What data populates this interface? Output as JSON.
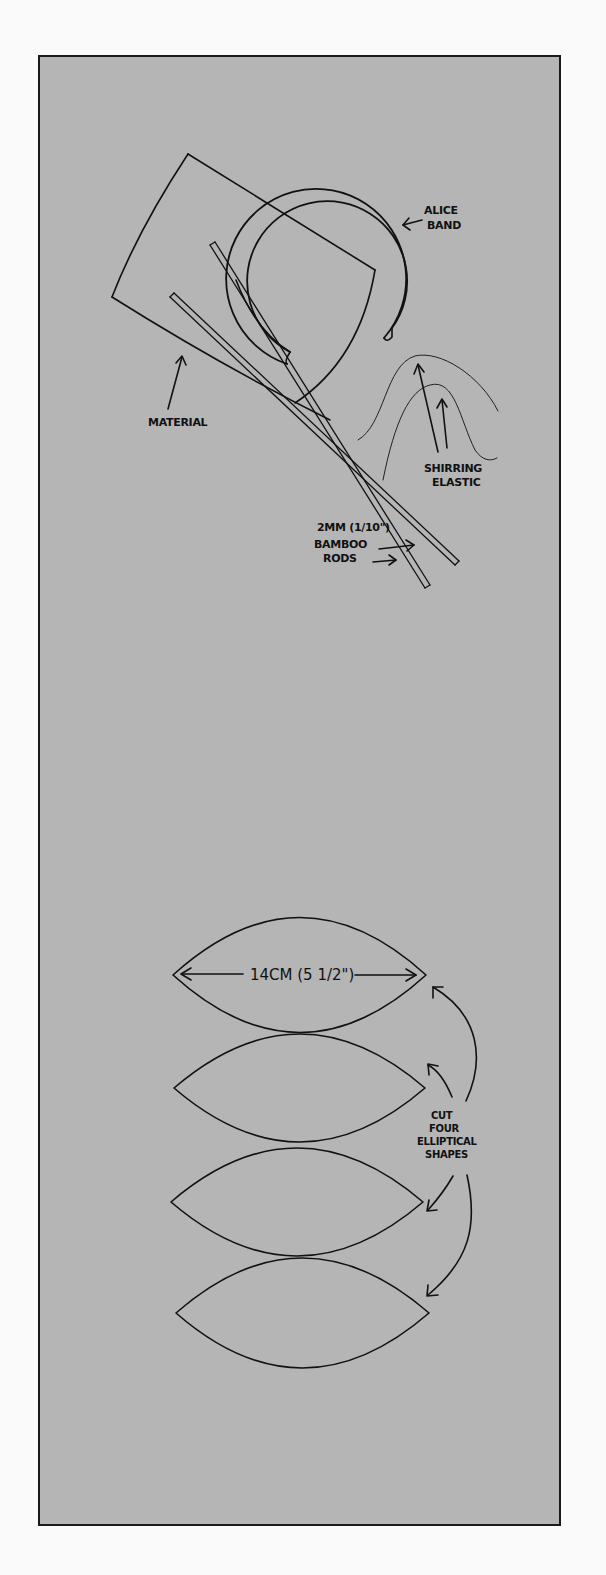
{
  "figure": {
    "background_color": "#b5b5b5",
    "line_color": "#111111",
    "top_illustration": {
      "labels": {
        "alice_band": [
          "ALICE",
          "BAND"
        ],
        "material": "MATERIAL",
        "shirring_elastic": [
          "SHIRRING",
          "ELASTIC"
        ],
        "bamboo_rods": [
          "2MM (1/10\")",
          "BAMBOO",
          "RODS"
        ]
      }
    },
    "bottom_illustration": {
      "dimension_label": "14CM (5 1/2\")",
      "instruction": [
        "CUT",
        "FOUR",
        "ELLIPTICAL",
        "SHAPES"
      ],
      "shape_count": 4
    }
  }
}
